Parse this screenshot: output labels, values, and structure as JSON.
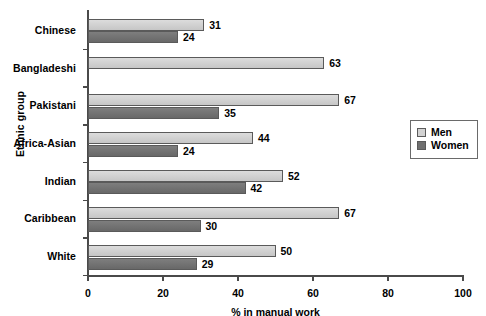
{
  "chart_data": {
    "type": "bar",
    "orientation": "horizontal",
    "title": "",
    "xlabel": "% in manual work",
    "ylabel": "Ethnic group",
    "xlim": [
      0,
      100
    ],
    "xticks": [
      0,
      20,
      40,
      60,
      80,
      100
    ],
    "grid": false,
    "legend_position": "right",
    "categories": [
      "Chinese",
      "Bangladeshi",
      "Pakistani",
      "Africa-Asian",
      "Indian",
      "Caribbean",
      "White"
    ],
    "series": [
      {
        "name": "Men",
        "color": "#d2d2d2",
        "values": [
          31,
          63,
          67,
          44,
          52,
          67,
          50
        ],
        "value_labels": [
          "31",
          "63",
          "67",
          "44",
          "52",
          "67",
          "50"
        ]
      },
      {
        "name": "Women",
        "color": "#6f6f6f",
        "values": [
          24,
          null,
          35,
          24,
          42,
          30,
          29
        ],
        "value_labels": [
          "24",
          "",
          "35",
          "24",
          "42",
          "30",
          "29"
        ]
      }
    ]
  },
  "legend": {
    "entries": [
      {
        "label": "Men"
      },
      {
        "label": "Women"
      }
    ]
  },
  "axes": {
    "x_title": "% in manual work",
    "y_title": "Ethnic group",
    "x_tick_labels": [
      "0",
      "20",
      "40",
      "60",
      "80",
      "100"
    ]
  }
}
